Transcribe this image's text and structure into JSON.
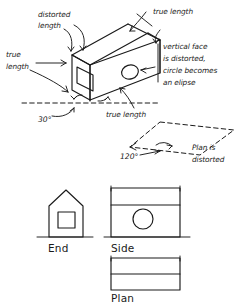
{
  "diagram": {
    "ink_color": "#1a1a1a",
    "background_color": "#ffffff",
    "annotations": {
      "distorted_length": "distorted\nlength",
      "distorted_length_line1": "distorted",
      "distorted_length_line2": "length",
      "true_length_left_line1": "true",
      "true_length_left_line2": "length",
      "true_length_top": "true length",
      "true_length_bottom": "true length",
      "vertical_face_line1": "vertical face",
      "vertical_face_line2": "is distorted,",
      "vertical_face_line3": "circle becomes",
      "vertical_face_line4": "an elipse",
      "angle_30": "30°",
      "angle_120": "120°",
      "plan_distorted_line1": "Plan is",
      "plan_distorted_line2": "distorted"
    },
    "orthographic_views": [
      {
        "name": "end-view",
        "label": "End",
        "feature": "square window"
      },
      {
        "name": "side-view",
        "label": "Side",
        "feature": "circle"
      },
      {
        "name": "plan-view",
        "label": "Plan",
        "feature": "ridge line"
      }
    ]
  }
}
